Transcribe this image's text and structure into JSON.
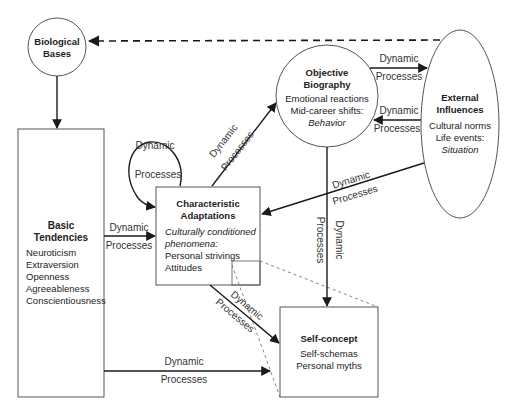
{
  "nodes": {
    "biological_bases": {
      "title_lines": [
        "Biological",
        "Bases"
      ]
    },
    "basic_tendencies": {
      "title_lines": [
        "Basic",
        "Tendencies"
      ],
      "items": [
        "Neuroticism",
        "Extraversion",
        "Openness",
        "Agreeableness",
        "Conscientiousness"
      ]
    },
    "characteristic_adaptations": {
      "title_lines": [
        "Characteristic",
        "Adaptations"
      ],
      "italic_lines": [
        "Culturally conditioned",
        "phenomena:"
      ],
      "items": [
        "Personal strivings",
        "Attitudes"
      ]
    },
    "objective_biography": {
      "title_lines": [
        "Objective",
        "Biography"
      ],
      "items": [
        "Emotional reactions",
        "Mid-career shifts:"
      ],
      "italic": "Behavior"
    },
    "external_influences": {
      "title_lines": [
        "External",
        "Influences"
      ],
      "items": [
        "Cultural norms",
        "Life events:"
      ],
      "italic": "Situation"
    },
    "self_concept": {
      "title": "Self-concept",
      "items": [
        "Self-schemas",
        "Personal myths"
      ]
    }
  },
  "edge_labels": {
    "line1": "Dynamic",
    "line2": "Processes"
  },
  "colors": {
    "stroke": "#1a1a1a",
    "text": "#222222",
    "dashed": "#555555"
  }
}
